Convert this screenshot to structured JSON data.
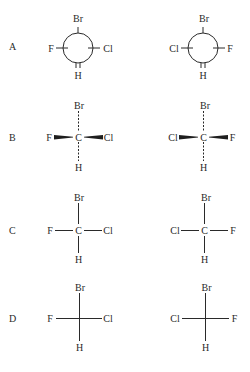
{
  "figure": {
    "rows": [
      {
        "label": "A",
        "style": "Newman projection",
        "left": {
          "top": "Br",
          "left": "F",
          "right": "Cl",
          "bottom": "H"
        },
        "right": {
          "top": "Br",
          "left": "Cl",
          "right": "F",
          "bottom": "H"
        }
      },
      {
        "label": "B",
        "style": "Wedge-dash (horizontal wedges, vertical dashes)",
        "left": {
          "top": "Br",
          "left": "F",
          "center": "C",
          "right": "Cl",
          "bottom": "H"
        },
        "right": {
          "top": "Br",
          "left": "Cl",
          "center": "C",
          "right": "F",
          "bottom": "H"
        }
      },
      {
        "label": "C",
        "style": "Line structure with central carbon",
        "left": {
          "top": "Br",
          "left": "F",
          "center": "C",
          "right": "Cl",
          "bottom": "H"
        },
        "right": {
          "top": "Br",
          "left": "Cl",
          "center": "C",
          "right": "F",
          "bottom": "H"
        }
      },
      {
        "label": "D",
        "style": "Fischer projection",
        "left": {
          "top": "Br",
          "left": "F",
          "right": "Cl",
          "bottom": "H"
        },
        "right": {
          "top": "Br",
          "left": "Cl",
          "right": "F",
          "bottom": "H"
        }
      }
    ],
    "colors": {
      "ink": "#2a2a2a",
      "background": "#ffffff"
    }
  }
}
